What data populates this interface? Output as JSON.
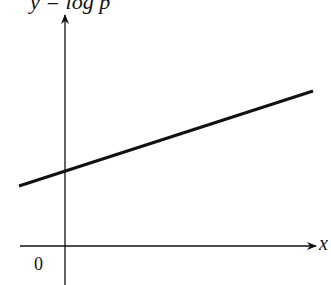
{
  "diagram": {
    "y_axis_label": "y = log p",
    "x_axis_label": "x",
    "origin_label": "0",
    "line": {
      "description": "straight line with positive slope crossing the y-axis above origin",
      "color": "#111111"
    }
  }
}
